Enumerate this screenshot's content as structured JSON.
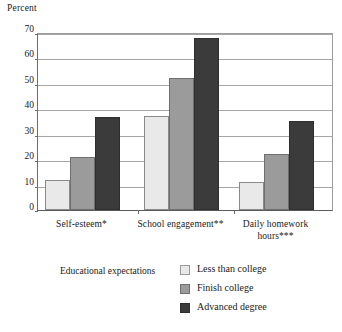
{
  "chart_data": {
    "type": "bar",
    "title": "",
    "subtitle": "",
    "xlabel": "",
    "ylabel": "Percent",
    "ylim": [
      0,
      70
    ],
    "yticks": [
      0,
      10,
      20,
      30,
      40,
      50,
      60,
      70
    ],
    "grid": true,
    "grid_axis": "y",
    "legend_position": "bottom",
    "legend_title": "Educational expectations",
    "categories": [
      "Self-esteem*",
      "School engagement**",
      "Daily homework hours***"
    ],
    "series": [
      {
        "name": "Less than college",
        "color": "#e9e9e9",
        "values": [
          12,
          37,
          11
        ]
      },
      {
        "name": "Finish college",
        "color": "#9b9b9b",
        "values": [
          21,
          52,
          22
        ]
      },
      {
        "name": "Advanced degree",
        "color": "#3b3b3b",
        "values": [
          36.5,
          67.5,
          35
        ]
      }
    ],
    "footnotes": [
      "*",
      "**",
      "***"
    ]
  },
  "axis": {
    "y_title": "Percent",
    "tick_labels": [
      "70",
      "60",
      "50",
      "40",
      "30",
      "20",
      "10",
      "0"
    ]
  },
  "categories": [
    {
      "line1": "Self-esteem*",
      "line2": ""
    },
    {
      "line1": "School engagement**",
      "line2": ""
    },
    {
      "line1": "Daily homework",
      "line2": "hours***"
    }
  ],
  "legend": {
    "title": "Educational expectations",
    "items": [
      {
        "label": "Less than college"
      },
      {
        "label": "Finish college"
      },
      {
        "label": "Advanced degree"
      }
    ]
  }
}
